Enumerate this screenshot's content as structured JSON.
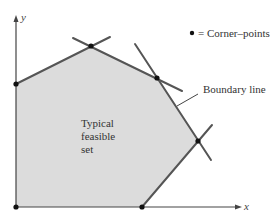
{
  "diagram": {
    "axes": {
      "x_label": "x",
      "y_label": "y"
    },
    "region_label": [
      "Typical",
      "feasible",
      "set"
    ],
    "legend": {
      "marker": "•",
      "text": "= Corner–points"
    },
    "annotation": {
      "text": "Boundary line"
    },
    "colors": {
      "region_fill": "#dcdcdc",
      "boundary": "#555555",
      "axis": "#444444",
      "point": "#111111"
    },
    "corner_points": [
      {
        "x": 16,
        "y": 207
      },
      {
        "x": 16,
        "y": 84
      },
      {
        "x": 91,
        "y": 46
      },
      {
        "x": 157,
        "y": 78
      },
      {
        "x": 198,
        "y": 141
      },
      {
        "x": 142,
        "y": 207
      }
    ]
  }
}
